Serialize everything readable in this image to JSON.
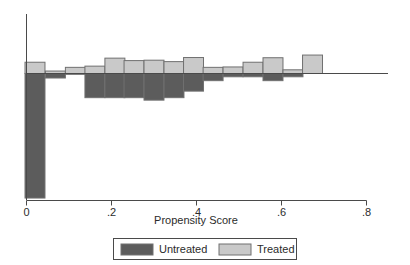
{
  "chart_data": {
    "type": "bar",
    "title": "",
    "subtitle": "",
    "xlabel": "Propensity Score",
    "ylabel": "",
    "xlim": [
      0,
      0.8
    ],
    "ylim": [
      -0.62,
      0.14
    ],
    "xticks": [
      0,
      0.2,
      0.4,
      0.6,
      0.8
    ],
    "xticklabels": [
      "0",
      ".2",
      ".4",
      ".6",
      ".8"
    ],
    "yticks": [],
    "yticklabels": [],
    "grid": false,
    "legend_position": "below-axis",
    "orientation": "back-to-back-histogram",
    "bin_width": 0.047,
    "series": [
      {
        "name": "Untreated",
        "color": "#5c5c5c",
        "direction": "down",
        "values": [
          -0.608,
          -0.022,
          -0.004,
          -0.118,
          -0.118,
          -0.118,
          -0.13,
          -0.118,
          -0.086,
          -0.035,
          -0.016,
          -0.016,
          -0.035,
          -0.016,
          -0.002
        ]
      },
      {
        "name": "Treated",
        "color": "#c9c9c9",
        "direction": "up",
        "values": [
          0.055,
          0.012,
          0.03,
          0.036,
          0.075,
          0.063,
          0.065,
          0.058,
          0.078,
          0.03,
          0.032,
          0.055,
          0.077,
          0.018,
          0.09
        ]
      }
    ],
    "bin_centers": [
      0.02,
      0.068,
      0.115,
      0.161,
      0.208,
      0.253,
      0.3,
      0.347,
      0.393,
      0.439,
      0.486,
      0.533,
      0.58,
      0.627,
      0.673
    ],
    "annotations": []
  },
  "legend": {
    "items": [
      {
        "label": "Untreated",
        "swatch_color": "#5c5c5c"
      },
      {
        "label": "Treated",
        "swatch_color": "#c9c9c9"
      }
    ]
  },
  "axis": {
    "x_title": "Propensity Score",
    "zero_line": true
  },
  "colors": {
    "untreated": "#5c5c5c",
    "treated": "#c9c9c9",
    "bar_stroke": "#707070",
    "axis": "#4a4a4a",
    "background": "#ffffff",
    "text": "#2b2b2b"
  }
}
